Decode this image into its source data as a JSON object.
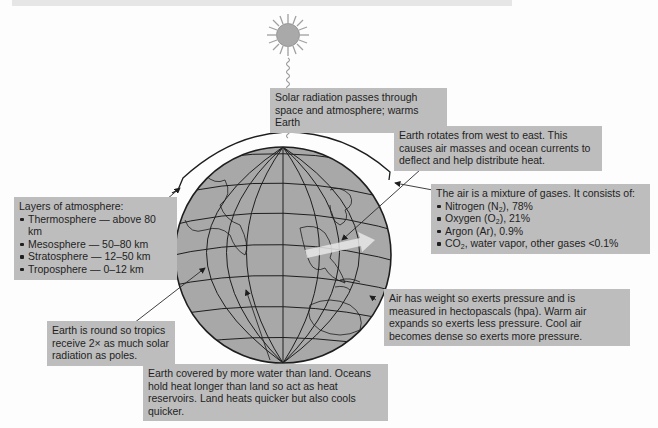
{
  "diagram": {
    "elements": {
      "sun": {
        "icon": "sun-icon",
        "colors": {
          "body": "#a9a9a9",
          "rays": "#9a9a9a"
        }
      },
      "earth": {
        "icon": "globe-icon",
        "colors": {
          "fill": "#a8a8a8",
          "grid": "#1e1e1e"
        }
      },
      "atmosphere_arc": {
        "icon": "atmosphere-arc-icon"
      },
      "wind_arrow": {
        "icon": "arrow-right-icon",
        "color": "#e9e9e9"
      }
    }
  },
  "callouts": {
    "solar": {
      "text": "Solar radiation passes through space and atmosphere; warms Earth"
    },
    "rotation": {
      "text": "Earth rotates from west to east. This causes air masses and ocean currents to deflect and help distribute heat."
    },
    "air_mixture": {
      "heading": "The air is a mixture of gases. It consists of:",
      "items": [
        {
          "label": "Nitrogen (N",
          "sub": "2",
          "rest": "), 78%"
        },
        {
          "label": "Oxygen (O",
          "sub": "2",
          "rest": "), 21%"
        },
        {
          "label": "Argon (Ar), 0.9%",
          "sub": "",
          "rest": ""
        },
        {
          "label": "CO",
          "sub": "2",
          "rest": ", water vapor, other gases <0.1%"
        }
      ]
    },
    "layers": {
      "heading": "Layers of atmosphere:",
      "items": [
        "Thermosphere — above 80 km",
        "Mesosphere — 50–80 km",
        "Stratosphere — 12–50 km",
        "Troposphere — 0–12 km"
      ]
    },
    "round": {
      "text": "Earth is round so tropics receive 2× as much solar radiation as poles."
    },
    "pressure": {
      "text": "Air has weight so exerts pressure and is measured in hectopascals (hpa). Warm air expands so exerts less pressure. Cool air becomes dense so exerts more pressure."
    },
    "water": {
      "text": "Earth covered by more water than land. Oceans hold heat longer than land so act as heat reservoirs. Land heats quicker but also cools quicker."
    }
  },
  "colors": {
    "callout_bg": "#bdbdbd",
    "text": "#1f1f1f",
    "background": "#fdfdfd"
  }
}
